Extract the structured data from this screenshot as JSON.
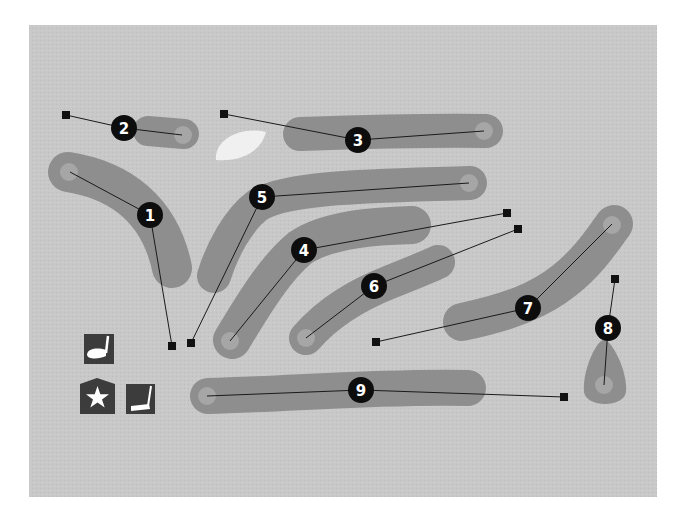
{
  "map": {
    "type": "golf-course-layout",
    "colors": {
      "background": "#c8c8c8",
      "fairway": "#8e8e8e",
      "green": "#a6a6a6",
      "bunker": "#f0f0f0",
      "line": "#1a1a1a",
      "tee": "#111111",
      "badge": "#0d0d0d",
      "badge_text": "#ffffff"
    },
    "holes": [
      {
        "number": "1",
        "label": [
          150,
          215
        ],
        "tee": [
          172,
          346
        ],
        "green": [
          70,
          172
        ]
      },
      {
        "number": "2",
        "label": [
          124,
          128
        ],
        "tee": [
          66,
          115
        ],
        "green": [
          182,
          135
        ]
      },
      {
        "number": "3",
        "label": [
          358,
          140
        ],
        "tee": [
          224,
          114
        ],
        "green": [
          484,
          131
        ]
      },
      {
        "number": "4",
        "label": [
          304,
          250
        ],
        "tee": [
          507,
          213
        ],
        "green": [
          230,
          341
        ]
      },
      {
        "number": "5",
        "label": [
          262,
          197
        ],
        "tee": [
          191,
          343
        ],
        "green": [
          469,
          183
        ]
      },
      {
        "number": "6",
        "label": [
          374,
          286
        ],
        "tee": [
          518,
          229
        ],
        "green": [
          306,
          338
        ]
      },
      {
        "number": "7",
        "label": [
          528,
          308
        ],
        "tee": [
          376,
          342
        ],
        "green": [
          612,
          224
        ]
      },
      {
        "number": "8",
        "label": [
          608,
          328
        ],
        "tee": [
          615,
          279
        ],
        "green": [
          604,
          385
        ]
      },
      {
        "number": "9",
        "label": [
          361,
          390
        ],
        "tee": [
          564,
          397
        ],
        "green": [
          207,
          396
        ]
      }
    ],
    "legend": [
      {
        "name": "driving-range",
        "icon": "golf-driver-icon"
      },
      {
        "name": "clubhouse",
        "icon": "star-clubhouse-icon"
      },
      {
        "name": "putting-green",
        "icon": "golf-putter-icon"
      }
    ]
  }
}
